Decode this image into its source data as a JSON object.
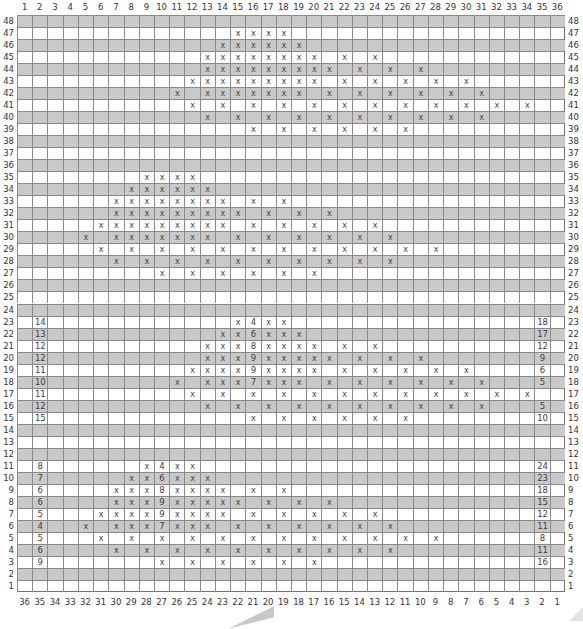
{
  "chart": {
    "columns": 36,
    "rows": 48,
    "top_column_labels": [
      "1",
      "2",
      "3",
      "4",
      "5",
      "6",
      "7",
      "8",
      "9",
      "10",
      "11",
      "12",
      "13",
      "14",
      "15",
      "16",
      "17",
      "18",
      "19",
      "20",
      "21",
      "22",
      "23",
      "24",
      "25",
      "26",
      "27",
      "28",
      "29",
      "30",
      "31",
      "32",
      "33",
      "34",
      "35",
      "36"
    ],
    "bottom_column_labels": [
      "36",
      "35",
      "34",
      "33",
      "32",
      "31",
      "30",
      "29",
      "28",
      "27",
      "26",
      "25",
      "24",
      "23",
      "22",
      "21",
      "20",
      "19",
      "18",
      "17",
      "16",
      "15",
      "14",
      "13",
      "12",
      "11",
      "10",
      "9",
      "8",
      "7",
      "6",
      "5",
      "4",
      "3",
      "2",
      "1"
    ],
    "row_labels_top_to_bottom": [
      "48",
      "47",
      "46",
      "45",
      "44",
      "43",
      "42",
      "41",
      "40",
      "39",
      "38",
      "37",
      "36",
      "35",
      "34",
      "33",
      "32",
      "31",
      "30",
      "29",
      "28",
      "27",
      "26",
      "25",
      "24",
      "23",
      "22",
      "21",
      "20",
      "19",
      "18",
      "17",
      "16",
      "15",
      "14",
      "13",
      "12",
      "11",
      "10",
      "9",
      "8",
      "7",
      "6",
      "5",
      "4",
      "3",
      "2",
      "1"
    ],
    "shaded_rows": "even",
    "colors": {
      "shade": "#c9c9c9",
      "grid_line": "#8a8a8a",
      "text": "#3a3a3a",
      "background": "#ffffff"
    },
    "symbol": "x",
    "row_cells": {
      "48": {},
      "47": {
        "15": "x",
        "16": "x",
        "17": "x",
        "18": "x"
      },
      "46": {
        "14": "x",
        "15": "x",
        "16": "x",
        "17": "x",
        "18": "x",
        "19": "x"
      },
      "45": {
        "13": "x",
        "14": "x",
        "15": "x",
        "16": "x",
        "17": "x",
        "18": "x",
        "19": "x",
        "20": "x",
        "22": "x",
        "24": "x"
      },
      "44": {
        "13": "x",
        "14": "x",
        "15": "x",
        "16": "x",
        "17": "x",
        "18": "x",
        "19": "x",
        "20": "x",
        "21": "x",
        "23": "x",
        "25": "x",
        "27": "x"
      },
      "43": {
        "12": "x",
        "13": "x",
        "14": "x",
        "15": "x",
        "16": "x",
        "17": "x",
        "18": "x",
        "19": "x",
        "20": "x",
        "22": "x",
        "24": "x",
        "26": "x",
        "28": "x",
        "30": "x"
      },
      "42": {
        "11": "x",
        "13": "x",
        "14": "x",
        "15": "x",
        "16": "x",
        "17": "x",
        "18": "x",
        "19": "x",
        "21": "x",
        "23": "x",
        "25": "x",
        "27": "x",
        "29": "x",
        "31": "x"
      },
      "41": {
        "12": "x",
        "14": "x",
        "16": "x",
        "18": "x",
        "20": "x",
        "22": "x",
        "24": "x",
        "26": "x",
        "28": "x",
        "30": "x",
        "32": "x",
        "34": "x"
      },
      "40": {
        "13": "x",
        "15": "x",
        "17": "x",
        "19": "x",
        "21": "x",
        "23": "x",
        "25": "x",
        "27": "x",
        "29": "x",
        "31": "x"
      },
      "39": {
        "16": "x",
        "18": "x",
        "20": "x",
        "22": "x",
        "24": "x",
        "26": "x"
      },
      "38": {},
      "37": {},
      "36": {},
      "35": {
        "9": "x",
        "10": "x",
        "11": "x",
        "12": "x"
      },
      "34": {
        "8": "x",
        "9": "x",
        "10": "x",
        "11": "x",
        "12": "x",
        "13": "x"
      },
      "33": {
        "7": "x",
        "8": "x",
        "9": "x",
        "10": "x",
        "11": "x",
        "12": "x",
        "13": "x",
        "14": "x",
        "16": "x",
        "18": "x"
      },
      "32": {
        "7": "x",
        "8": "x",
        "9": "x",
        "10": "x",
        "11": "x",
        "12": "x",
        "13": "x",
        "14": "x",
        "15": "x",
        "17": "x",
        "19": "x",
        "21": "x"
      },
      "31": {
        "6": "x",
        "7": "x",
        "8": "x",
        "9": "x",
        "10": "x",
        "11": "x",
        "12": "x",
        "13": "x",
        "14": "x",
        "16": "x",
        "18": "x",
        "20": "x",
        "22": "x",
        "24": "x"
      },
      "30": {
        "5": "x",
        "7": "x",
        "8": "x",
        "9": "x",
        "10": "x",
        "11": "x",
        "12": "x",
        "13": "x",
        "15": "x",
        "17": "x",
        "19": "x",
        "21": "x",
        "23": "x",
        "25": "x"
      },
      "29": {
        "6": "x",
        "8": "x",
        "10": "x",
        "12": "x",
        "14": "x",
        "16": "x",
        "18": "x",
        "20": "x",
        "22": "x",
        "24": "x",
        "26": "x",
        "28": "x"
      },
      "28": {
        "7": "x",
        "9": "x",
        "11": "x",
        "13": "x",
        "15": "x",
        "17": "x",
        "19": "x",
        "21": "x",
        "23": "x",
        "25": "x"
      },
      "27": {
        "10": "x",
        "12": "x",
        "14": "x",
        "16": "x",
        "18": "x",
        "20": "x"
      },
      "26": {},
      "25": {},
      "24": {},
      "23": {
        "2": "14",
        "15": "x",
        "16": "4",
        "17": "x",
        "18": "x",
        "35": "18"
      },
      "22": {
        "2": "13",
        "14": "x",
        "15": "x",
        "16": "6",
        "17": "x",
        "18": "x",
        "19": "x",
        "35": "17"
      },
      "21": {
        "2": "12",
        "13": "x",
        "14": "x",
        "15": "x",
        "16": "8",
        "17": "x",
        "18": "x",
        "19": "x",
        "20": "x",
        "22": "x",
        "24": "x",
        "35": "12"
      },
      "20": {
        "2": "12",
        "13": "x",
        "14": "x",
        "15": "x",
        "16": "9",
        "17": "x",
        "18": "x",
        "19": "x",
        "20": "x",
        "21": "x",
        "23": "x",
        "25": "x",
        "27": "x",
        "35": "9"
      },
      "19": {
        "2": "11",
        "12": "x",
        "13": "x",
        "14": "x",
        "15": "x",
        "16": "9",
        "17": "x",
        "18": "x",
        "19": "x",
        "20": "x",
        "22": "x",
        "24": "x",
        "26": "x",
        "28": "x",
        "30": "x",
        "35": "6"
      },
      "18": {
        "2": "10",
        "11": "x",
        "13": "x",
        "14": "x",
        "15": "x",
        "16": "7",
        "17": "x",
        "18": "x",
        "19": "x",
        "21": "x",
        "23": "x",
        "25": "x",
        "27": "x",
        "29": "x",
        "31": "x",
        "35": "5"
      },
      "17": {
        "2": "11",
        "12": "x",
        "14": "x",
        "16": "x",
        "18": "x",
        "20": "x",
        "22": "x",
        "24": "x",
        "26": "x",
        "28": "x",
        "30": "x",
        "32": "x",
        "34": "x"
      },
      "16": {
        "2": "12",
        "13": "x",
        "15": "x",
        "17": "x",
        "19": "x",
        "21": "x",
        "23": "x",
        "25": "x",
        "27": "x",
        "29": "x",
        "31": "x",
        "35": "5"
      },
      "15": {
        "2": "15",
        "16": "x",
        "18": "x",
        "20": "x",
        "22": "x",
        "24": "x",
        "26": "x",
        "35": "10"
      },
      "14": {},
      "13": {},
      "12": {},
      "11": {
        "2": "8",
        "9": "x",
        "10": "4",
        "11": "x",
        "12": "x",
        "35": "24"
      },
      "10": {
        "2": "7",
        "8": "x",
        "9": "x",
        "10": "6",
        "11": "x",
        "12": "x",
        "13": "x",
        "35": "23"
      },
      "9": {
        "2": "6",
        "7": "x",
        "8": "x",
        "9": "x",
        "10": "8",
        "11": "x",
        "12": "x",
        "13": "x",
        "14": "x",
        "16": "x",
        "18": "x",
        "35": "18"
      },
      "8": {
        "2": "6",
        "7": "x",
        "8": "x",
        "9": "x",
        "10": "9",
        "11": "x",
        "12": "x",
        "13": "x",
        "14": "x",
        "15": "x",
        "17": "x",
        "19": "x",
        "21": "x",
        "35": "15"
      },
      "7": {
        "2": "5",
        "6": "x",
        "7": "x",
        "8": "x",
        "9": "x",
        "10": "9",
        "11": "x",
        "12": "x",
        "13": "x",
        "14": "x",
        "16": "x",
        "18": "x",
        "20": "x",
        "22": "x",
        "24": "x",
        "35": "12"
      },
      "6": {
        "2": "4",
        "5": "x",
        "7": "x",
        "8": "x",
        "9": "x",
        "10": "7",
        "11": "x",
        "12": "x",
        "13": "x",
        "15": "x",
        "17": "x",
        "19": "x",
        "21": "x",
        "23": "x",
        "25": "x",
        "35": "11"
      },
      "5": {
        "2": "5",
        "6": "x",
        "8": "x",
        "10": "x",
        "12": "x",
        "14": "x",
        "16": "x",
        "18": "x",
        "20": "x",
        "22": "x",
        "24": "x",
        "26": "x",
        "28": "x",
        "35": "8"
      },
      "4": {
        "2": "6",
        "7": "x",
        "9": "x",
        "11": "x",
        "13": "x",
        "15": "x",
        "17": "x",
        "19": "x",
        "21": "x",
        "23": "x",
        "25": "x",
        "35": "11"
      },
      "3": {
        "2": "9",
        "10": "x",
        "12": "x",
        "14": "x",
        "16": "x",
        "18": "x",
        "20": "x",
        "35": "16"
      },
      "2": {},
      "1": {}
    }
  }
}
